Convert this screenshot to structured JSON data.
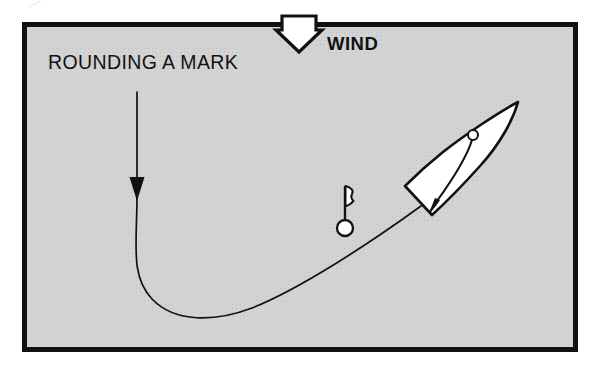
{
  "figure": {
    "type": "sailing-maneuver-diagram",
    "title": "ROUNDING A MARK",
    "background_color": "#d2d2d2",
    "ink_color": "#111111",
    "paper_color": "#ffffff",
    "border": {
      "x": 22,
      "y": 22,
      "width": 556,
      "height": 330,
      "stroke_width": 5
    }
  },
  "labels": {
    "maneuver_title": "ROUNDING A MARK",
    "wind_label": "WIND"
  },
  "annotations": {
    "wind_arrow": {
      "name": "wind-arrow",
      "description": "hollow white downward arrow straddling the top border",
      "direction": "down",
      "fill": "#ffffff",
      "stroke": "#111111"
    },
    "approach_arrow": {
      "name": "approach-direction-arrow",
      "description": "solid black downward arrow on the approach leg of the course track",
      "direction": "down",
      "fill": "#111111"
    },
    "course_track": {
      "name": "course-track",
      "description": "curved path showing the boat rounding the mark from downwind approach to close-hauled exit",
      "stroke": "#111111",
      "stroke_width": 1.6
    }
  },
  "objects": {
    "mark": {
      "name": "racing-mark-buoy",
      "description": "buoy with staff and pennant flag",
      "buoy_fill": "#ffffff",
      "buoy_stroke": "#111111",
      "center_x": 345,
      "center_y": 228,
      "radius": 8
    },
    "boat": {
      "name": "sailboat",
      "description": "overhead view of a sailboat, bow to upper right, transom to lower left",
      "hull_fill": "#ffffff",
      "hull_stroke": "#111111",
      "mast": {
        "name": "mast",
        "x": 473,
        "y": 135,
        "radius": 5,
        "fill": "#ffffff"
      },
      "sail": {
        "name": "mainsail",
        "description": "curved sail sweeping aft from the mast to the transom"
      }
    }
  }
}
